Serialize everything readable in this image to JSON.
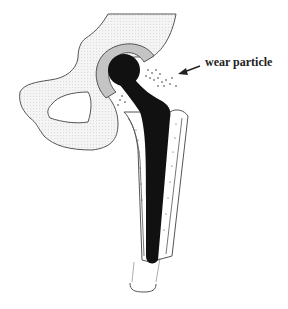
{
  "figure": {
    "labels": [
      {
        "id": "wear-particle",
        "text": "wear particle"
      }
    ],
    "components": [
      "pelvis",
      "acetabular-cup",
      "femoral-head",
      "femoral-stem",
      "bone-cement",
      "femur"
    ],
    "colors": {
      "pelvis_fill": "#f1f1f1",
      "cup_fill": "#c4c4c4",
      "implant_fill": "#111111",
      "outline": "#555555",
      "text": "#222222"
    }
  }
}
